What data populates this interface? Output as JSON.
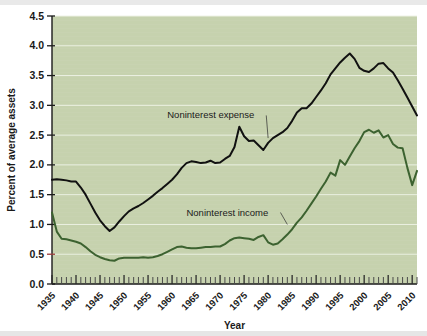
{
  "chart_data": {
    "type": "line",
    "title": "",
    "xlabel": "Year",
    "ylabel": "Percent of average assets",
    "xlim": [
      1935,
      2011
    ],
    "ylim": [
      0.0,
      4.5
    ],
    "y_ticks": [
      "0.0",
      "0.5",
      "1.0",
      "1.5",
      "2.0",
      "2.5",
      "3.0",
      "3.5",
      "4.0",
      "4.5"
    ],
    "y_tick_values": [
      0.0,
      0.5,
      1.0,
      1.5,
      2.0,
      2.5,
      3.0,
      3.5,
      4.0,
      4.5
    ],
    "x_ticks": [
      "1935",
      "1940",
      "1945",
      "1950",
      "1955",
      "1960",
      "1965",
      "1970",
      "1975",
      "1980",
      "1985",
      "1990",
      "1995",
      "2000",
      "2005",
      "2010"
    ],
    "x_tick_values": [
      1935,
      1940,
      1945,
      1950,
      1955,
      1960,
      1965,
      1970,
      1975,
      1980,
      1985,
      1990,
      1995,
      2000,
      2005,
      2010
    ],
    "minor_tick_interval": 1,
    "grid": "horizontal-only",
    "legend_position": "inline-annotation",
    "plot_background": "#c6d2ae",
    "x": [
      1935,
      1936,
      1937,
      1938,
      1939,
      1940,
      1941,
      1942,
      1943,
      1944,
      1945,
      1946,
      1947,
      1948,
      1949,
      1950,
      1951,
      1952,
      1953,
      1954,
      1955,
      1956,
      1957,
      1958,
      1959,
      1960,
      1961,
      1962,
      1963,
      1964,
      1965,
      1966,
      1967,
      1968,
      1969,
      1970,
      1971,
      1972,
      1973,
      1974,
      1975,
      1976,
      1977,
      1978,
      1979,
      1980,
      1981,
      1982,
      1983,
      1984,
      1985,
      1986,
      1987,
      1988,
      1989,
      1990,
      1991,
      1992,
      1993,
      1994,
      1995,
      1996,
      1997,
      1998,
      1999,
      2000,
      2001,
      2002,
      2003,
      2004,
      2005,
      2006,
      2007,
      2008,
      2009,
      2010,
      2011
    ],
    "series": [
      {
        "name": "Noninterest expense",
        "color": "#111111",
        "values": [
          1.75,
          1.76,
          1.75,
          1.74,
          1.72,
          1.72,
          1.62,
          1.5,
          1.35,
          1.2,
          1.07,
          0.97,
          0.89,
          0.95,
          1.05,
          1.14,
          1.22,
          1.27,
          1.31,
          1.36,
          1.42,
          1.48,
          1.55,
          1.61,
          1.68,
          1.75,
          1.84,
          1.95,
          2.03,
          2.06,
          2.05,
          2.03,
          2.04,
          2.07,
          2.03,
          2.04,
          2.1,
          2.15,
          2.3,
          2.64,
          2.48,
          2.4,
          2.41,
          2.33,
          2.25,
          2.37,
          2.45,
          2.5,
          2.55,
          2.62,
          2.74,
          2.88,
          2.95,
          2.95,
          3.03,
          3.14,
          3.25,
          3.37,
          3.52,
          3.62,
          3.72,
          3.8,
          3.87,
          3.78,
          3.63,
          3.58,
          3.56,
          3.62,
          3.7,
          3.71,
          3.62,
          3.55,
          3.42,
          3.28,
          3.13,
          2.98,
          2.83
        ],
        "notes": "2010 dip to ~2.83 then recovery to ~3.05 at 2011"
      },
      {
        "name": "Noninterest income",
        "color": "#3c6230",
        "values": [
          1.2,
          0.88,
          0.76,
          0.75,
          0.73,
          0.71,
          0.68,
          0.62,
          0.55,
          0.49,
          0.45,
          0.42,
          0.4,
          0.39,
          0.43,
          0.44,
          0.44,
          0.44,
          0.44,
          0.45,
          0.44,
          0.45,
          0.47,
          0.5,
          0.54,
          0.58,
          0.62,
          0.63,
          0.61,
          0.6,
          0.6,
          0.61,
          0.62,
          0.62,
          0.63,
          0.63,
          0.67,
          0.73,
          0.77,
          0.78,
          0.77,
          0.76,
          0.74,
          0.79,
          0.82,
          0.7,
          0.66,
          0.68,
          0.75,
          0.83,
          0.92,
          1.03,
          1.12,
          1.23,
          1.35,
          1.47,
          1.6,
          1.72,
          1.87,
          1.82,
          2.08,
          2.0,
          2.14,
          2.28,
          2.4,
          2.55,
          2.59,
          2.54,
          2.58,
          2.46,
          2.5,
          2.35,
          2.29,
          2.28,
          1.95,
          1.66,
          1.9
        ],
        "notes": "peak ~2.6 around 2000-2003, sharp drop to ~1.66 in 2009-2010, recovery to ~1.95"
      }
    ],
    "annotations": [
      {
        "label": "Noninterest expense",
        "target_year": 1980,
        "target_value": 2.45,
        "text_x": 1959,
        "text_y": 2.78
      },
      {
        "label": "Noninterest income",
        "target_year": 1984,
        "target_value": 1.0,
        "text_x": 1963,
        "text_y": 1.15
      }
    ]
  }
}
